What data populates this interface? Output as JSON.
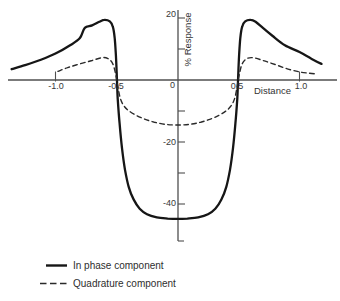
{
  "figure": {
    "background": "#ffffff",
    "curve_color": "#161616",
    "axis_color": "#4f4f4f",
    "text_color": "#383838"
  },
  "chart_data": {
    "type": "line",
    "title": "",
    "xlabel": "Distance",
    "ylabel": "% Response",
    "xlim": [
      -1.38,
      1.33
    ],
    "ylim": [
      -52,
      22
    ],
    "grid": false,
    "legend_position": "bottom-left",
    "x_tick_values": [
      -1.0,
      -0.5,
      0.5,
      1.0
    ],
    "x_tick_labels": [
      "-1.0",
      "-0.5",
      "0.5",
      "1.0"
    ],
    "origin_label": "0",
    "y_tick_values": [
      20,
      -20,
      -40
    ],
    "y_tick_labels": [
      "20",
      "-20",
      "-40"
    ],
    "y_minor_tick_values": [
      10,
      -10,
      -30
    ],
    "series": [
      {
        "name": "In phase component",
        "style": "solid",
        "points": [
          [
            -1.36,
            3.5
          ],
          [
            -1.25,
            4.8
          ],
          [
            -1.12,
            6.5
          ],
          [
            -1.0,
            8.5
          ],
          [
            -0.88,
            11.2
          ],
          [
            -0.8,
            13.5
          ],
          [
            -0.76,
            16.8
          ],
          [
            -0.7,
            17.6
          ],
          [
            -0.64,
            18.8
          ],
          [
            -0.6,
            19.4
          ],
          [
            -0.555,
            18.9
          ],
          [
            -0.53,
            17.2
          ],
          [
            -0.515,
            13.5
          ],
          [
            -0.505,
            8.0
          ],
          [
            -0.497,
            0.5
          ],
          [
            -0.49,
            -6.0
          ],
          [
            -0.475,
            -14.0
          ],
          [
            -0.455,
            -22.0
          ],
          [
            -0.43,
            -29.0
          ],
          [
            -0.4,
            -34.5
          ],
          [
            -0.36,
            -38.5
          ],
          [
            -0.31,
            -41.5
          ],
          [
            -0.25,
            -43.3
          ],
          [
            -0.17,
            -44.3
          ],
          [
            -0.08,
            -44.7
          ],
          [
            0,
            -44.8
          ],
          [
            0.08,
            -44.7
          ],
          [
            0.17,
            -44.3
          ],
          [
            0.25,
            -43.3
          ],
          [
            0.31,
            -41.5
          ],
          [
            0.36,
            -38.5
          ],
          [
            0.4,
            -34.5
          ],
          [
            0.43,
            -29.0
          ],
          [
            0.455,
            -22.0
          ],
          [
            0.475,
            -14.0
          ],
          [
            0.49,
            -6.0
          ],
          [
            0.497,
            0.5
          ],
          [
            0.505,
            8.0
          ],
          [
            0.515,
            13.5
          ],
          [
            0.53,
            17.2
          ],
          [
            0.555,
            18.9
          ],
          [
            0.6,
            19.4
          ],
          [
            0.64,
            18.8
          ],
          [
            0.7,
            16.8
          ],
          [
            0.78,
            14.2
          ],
          [
            0.88,
            11.2
          ],
          [
            1.0,
            9.0
          ],
          [
            1.1,
            6.8
          ],
          [
            1.18,
            5.2
          ]
        ]
      },
      {
        "name": "Quadrature component",
        "style": "dashed",
        "points": [
          [
            -0.98,
            2.8
          ],
          [
            -0.9,
            4.0
          ],
          [
            -0.8,
            5.2
          ],
          [
            -0.7,
            6.3
          ],
          [
            -0.62,
            7.2
          ],
          [
            -0.57,
            6.9
          ],
          [
            -0.53,
            5.2
          ],
          [
            -0.505,
            1.5
          ],
          [
            -0.487,
            -2.5
          ],
          [
            -0.468,
            -6.0
          ],
          [
            -0.44,
            -8.3
          ],
          [
            -0.4,
            -9.9
          ],
          [
            -0.34,
            -11.4
          ],
          [
            -0.27,
            -12.6
          ],
          [
            -0.19,
            -13.6
          ],
          [
            -0.1,
            -14.3
          ],
          [
            0,
            -14.5
          ],
          [
            0.1,
            -14.3
          ],
          [
            0.19,
            -13.6
          ],
          [
            0.27,
            -12.6
          ],
          [
            0.34,
            -11.4
          ],
          [
            0.4,
            -9.9
          ],
          [
            0.44,
            -8.3
          ],
          [
            0.468,
            -6.0
          ],
          [
            0.487,
            -2.5
          ],
          [
            0.505,
            1.5
          ],
          [
            0.53,
            5.2
          ],
          [
            0.57,
            6.9
          ],
          [
            0.62,
            7.2
          ],
          [
            0.7,
            6.3
          ],
          [
            0.8,
            5.0
          ],
          [
            0.9,
            3.6
          ],
          [
            1.0,
            2.6
          ],
          [
            1.08,
            2.2
          ],
          [
            1.13,
            2.0
          ]
        ]
      }
    ]
  }
}
